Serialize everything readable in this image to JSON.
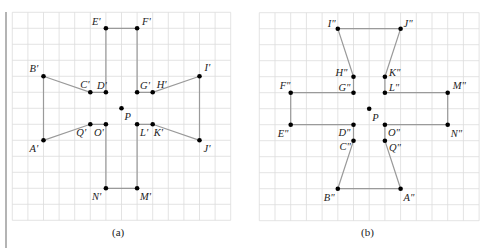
{
  "figure": {
    "panels": [
      {
        "id": "a",
        "caption": "(a)",
        "grid": {
          "x0": 12.3,
          "y0": 12.3,
          "dx": 15.6,
          "dy": 16,
          "cols": 14,
          "rows": 13
        },
        "center": {
          "name": "P",
          "col": 7,
          "row": 6,
          "label_dx": 3,
          "label_dy": 12
        },
        "polygon": [
          "E'",
          "F'",
          "G'",
          "H'",
          "I'",
          "J'",
          "K'",
          "L'",
          "M'",
          "N'",
          "O'",
          "Q'",
          "A'",
          "B'",
          "C'",
          "D'"
        ],
        "points": [
          {
            "name": "A'",
            "col": 2,
            "row": 8,
            "label_dx": -14,
            "label_dy": 12
          },
          {
            "name": "B'",
            "col": 2,
            "row": 4,
            "label_dx": -14,
            "label_dy": -4
          },
          {
            "name": "C'",
            "col": 5,
            "row": 5,
            "label_dx": -10,
            "label_dy": -4
          },
          {
            "name": "D'",
            "col": 6,
            "row": 5,
            "label_dx": -9,
            "label_dy": -3
          },
          {
            "name": "E'",
            "col": 6,
            "row": 1,
            "label_dx": -14,
            "label_dy": -3
          },
          {
            "name": "F'",
            "col": 8,
            "row": 1,
            "label_dx": 5,
            "label_dy": -3
          },
          {
            "name": "G'",
            "col": 8,
            "row": 5,
            "label_dx": 3,
            "label_dy": -3
          },
          {
            "name": "H'",
            "col": 9,
            "row": 5,
            "label_dx": 4,
            "label_dy": -4
          },
          {
            "name": "I'",
            "col": 12,
            "row": 4,
            "label_dx": 5,
            "label_dy": -5
          },
          {
            "name": "J'",
            "col": 12,
            "row": 8,
            "label_dx": 4,
            "label_dy": 12
          },
          {
            "name": "K'",
            "col": 9,
            "row": 7,
            "label_dx": 1,
            "label_dy": 12
          },
          {
            "name": "L'",
            "col": 8,
            "row": 7,
            "label_dx": 3,
            "label_dy": 12
          },
          {
            "name": "M'",
            "col": 8,
            "row": 11,
            "label_dx": 3,
            "label_dy": 12
          },
          {
            "name": "N'",
            "col": 6,
            "row": 11,
            "label_dx": -14,
            "label_dy": 12
          },
          {
            "name": "O'",
            "col": 6,
            "row": 7,
            "label_dx": -12,
            "label_dy": 12
          },
          {
            "name": "Q'",
            "col": 5,
            "row": 7,
            "label_dx": -14,
            "label_dy": 12
          }
        ]
      },
      {
        "id": "b",
        "caption": "(b)",
        "grid": {
          "x0": 259.3,
          "y0": 12.7,
          "dx": 15.7,
          "dy": 16,
          "cols": 14,
          "rows": 13
        },
        "center": {
          "name": "P",
          "col": 7,
          "row": 6,
          "label_dx": 3,
          "label_dy": 12
        },
        "polygon": [
          "I\"",
          "J\"",
          "K\"",
          "L\"",
          "M\"",
          "N\"",
          "O\"",
          "Q\"",
          "A\"",
          "B\"",
          "C\"",
          "D\"",
          "E\"",
          "F\"",
          "G\"",
          "H\""
        ],
        "points": [
          {
            "name": "A\"",
            "col": 9,
            "row": 11,
            "label_dx": 3,
            "label_dy": 12
          },
          {
            "name": "B\"",
            "col": 5,
            "row": 11,
            "label_dx": -14,
            "label_dy": 12
          },
          {
            "name": "C\"",
            "col": 6,
            "row": 8,
            "label_dx": -14,
            "label_dy": 9
          },
          {
            "name": "D\"",
            "col": 6,
            "row": 7,
            "label_dx": -15,
            "label_dy": 11
          },
          {
            "name": "E\"",
            "col": 2,
            "row": 7,
            "label_dx": -13,
            "label_dy": 12
          },
          {
            "name": "F\"",
            "col": 2,
            "row": 5,
            "label_dx": -11,
            "label_dy": -4
          },
          {
            "name": "G\"",
            "col": 6,
            "row": 5,
            "label_dx": -15,
            "label_dy": -2
          },
          {
            "name": "H\"",
            "col": 6,
            "row": 4,
            "label_dx": -18,
            "label_dy": -1
          },
          {
            "name": "I\"",
            "col": 5,
            "row": 1,
            "label_dx": -10,
            "label_dy": -2
          },
          {
            "name": "J\"",
            "col": 9,
            "row": 1,
            "label_dx": 3,
            "label_dy": -2
          },
          {
            "name": "K\"",
            "col": 8,
            "row": 4,
            "label_dx": 4,
            "label_dy": -1
          },
          {
            "name": "L\"",
            "col": 8,
            "row": 5,
            "label_dx": 4,
            "label_dy": -2
          },
          {
            "name": "M\"",
            "col": 12,
            "row": 5,
            "label_dx": 5,
            "label_dy": -4
          },
          {
            "name": "N\"",
            "col": 12,
            "row": 7,
            "label_dx": 3,
            "label_dy": 12
          },
          {
            "name": "O\"",
            "col": 8,
            "row": 7,
            "label_dx": 3,
            "label_dy": 11
          },
          {
            "name": "Q\"",
            "col": 8,
            "row": 8,
            "label_dx": 4,
            "label_dy": 10
          }
        ]
      }
    ],
    "captions": [
      {
        "text": "(a)",
        "x": 112,
        "y": 236
      },
      {
        "text": "(b)",
        "x": 361,
        "y": 236
      }
    ]
  }
}
